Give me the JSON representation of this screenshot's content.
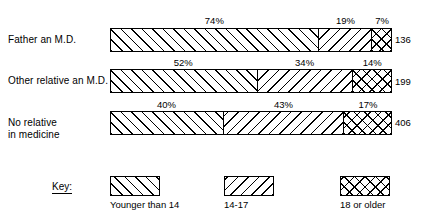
{
  "chart_data": {
    "type": "bar",
    "subtype": "100% stacked horizontal bar",
    "title": "",
    "subtitle": "",
    "xlabel": "",
    "ylabel": "",
    "xlim": [
      0,
      100
    ],
    "grid": false,
    "legend_position": "bottom",
    "categories": [
      "Father an M.D.",
      "Other relative an M.D.",
      "No relative\nin medicine"
    ],
    "series": [
      {
        "name": "Younger than 14",
        "values": [
          74,
          52,
          40
        ],
        "pattern": "forward-hatch"
      },
      {
        "name": "14-17",
        "values": [
          19,
          34,
          43
        ],
        "pattern": "backward-hatch"
      },
      {
        "name": "18 or older",
        "values": [
          7,
          14,
          17
        ],
        "pattern": "crosshatch"
      }
    ],
    "value_labels": [
      [
        "74%",
        "19%",
        "7%"
      ],
      [
        "52%",
        "34%",
        "14%"
      ],
      [
        "40%",
        "43%",
        "17%"
      ]
    ],
    "row_totals": [
      "136",
      "199",
      "406"
    ],
    "annotations": []
  },
  "rows": [
    {
      "label": "Father an M.D.",
      "total": "136",
      "segments": [
        {
          "label": "74%",
          "value": 74
        },
        {
          "label": "19%",
          "value": 19
        },
        {
          "label": "7%",
          "value": 7
        }
      ]
    },
    {
      "label": "Other relative an M.D.",
      "total": "199",
      "segments": [
        {
          "label": "52%",
          "value": 52
        },
        {
          "label": "34%",
          "value": 34
        },
        {
          "label": "14%",
          "value": 14
        }
      ]
    },
    {
      "label": "No relative\nin medicine",
      "total": "406",
      "segments": [
        {
          "label": "40%",
          "value": 40
        },
        {
          "label": "43%",
          "value": 43
        },
        {
          "label": "17%",
          "value": 17
        }
      ]
    }
  ],
  "key": {
    "title": "Key:",
    "items": [
      {
        "label": "Younger than 14"
      },
      {
        "label": "14-17"
      },
      {
        "label": "18 or older"
      }
    ]
  },
  "colors": {
    "ink": "#000000",
    "background": "#ffffff"
  }
}
